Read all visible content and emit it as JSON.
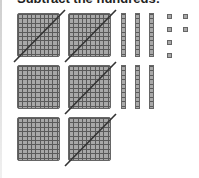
{
  "heading": "Subtract the hundreds:",
  "colors": {
    "block_fill": "#a8a8a8",
    "block_grid": "#5a5a5a",
    "slash": "#333333"
  },
  "hundreds": [
    {
      "x": 17,
      "y": 13,
      "crossed": true
    },
    {
      "x": 68,
      "y": 13,
      "crossed": true
    },
    {
      "x": 17,
      "y": 65,
      "crossed": false
    },
    {
      "x": 68,
      "y": 65,
      "crossed": true
    },
    {
      "x": 17,
      "y": 117,
      "crossed": false
    },
    {
      "x": 68,
      "y": 117,
      "crossed": true
    }
  ],
  "tens": [
    {
      "x": 121,
      "y": 13
    },
    {
      "x": 135,
      "y": 13
    },
    {
      "x": 149,
      "y": 13
    },
    {
      "x": 121,
      "y": 65
    },
    {
      "x": 135,
      "y": 65
    },
    {
      "x": 149,
      "y": 65
    }
  ],
  "ones": [
    {
      "x": 167,
      "y": 14
    },
    {
      "x": 167,
      "y": 27
    },
    {
      "x": 167,
      "y": 40
    },
    {
      "x": 167,
      "y": 53
    },
    {
      "x": 183,
      "y": 14
    },
    {
      "x": 183,
      "y": 27
    }
  ],
  "counts": {
    "hundreds": 6,
    "tens": 6,
    "ones": 6,
    "crossed_hundreds": 4
  }
}
